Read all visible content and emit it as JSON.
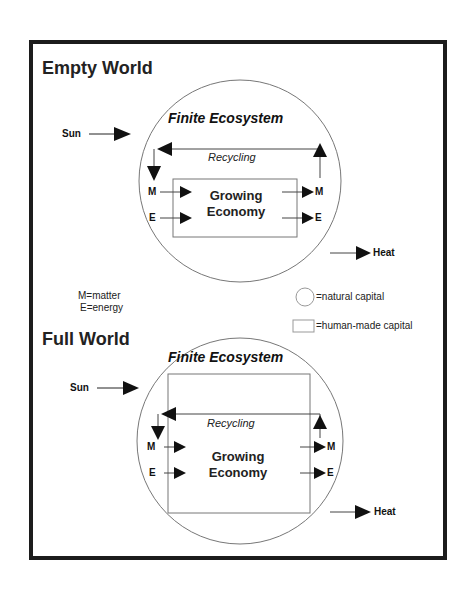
{
  "frame": {
    "border_color": "#1c1c1c"
  },
  "empty_world": {
    "title": "Empty World",
    "ecosystem_label": "Finite Ecosystem",
    "recycling_label": "Recycling",
    "economy_label_line1": "Growing",
    "economy_label_line2": "Economy",
    "sun_label": "Sun",
    "heat_label": "Heat",
    "input_m": "M",
    "input_e": "E",
    "output_m": "M",
    "output_e": "E"
  },
  "key": {
    "matter": "M=matter",
    "energy": "E=energy"
  },
  "legend": {
    "natural_capital": "=natural capital",
    "human_made_capital": "=human-made capital"
  },
  "full_world": {
    "title": "Full World",
    "ecosystem_label": "Finite Ecosystem",
    "recycling_label": "Recycling",
    "economy_label_line1": "Growing",
    "economy_label_line2": "Economy",
    "sun_label": "Sun",
    "heat_label": "Heat",
    "input_m": "M",
    "input_e": "E",
    "output_m": "M",
    "output_e": "E"
  }
}
